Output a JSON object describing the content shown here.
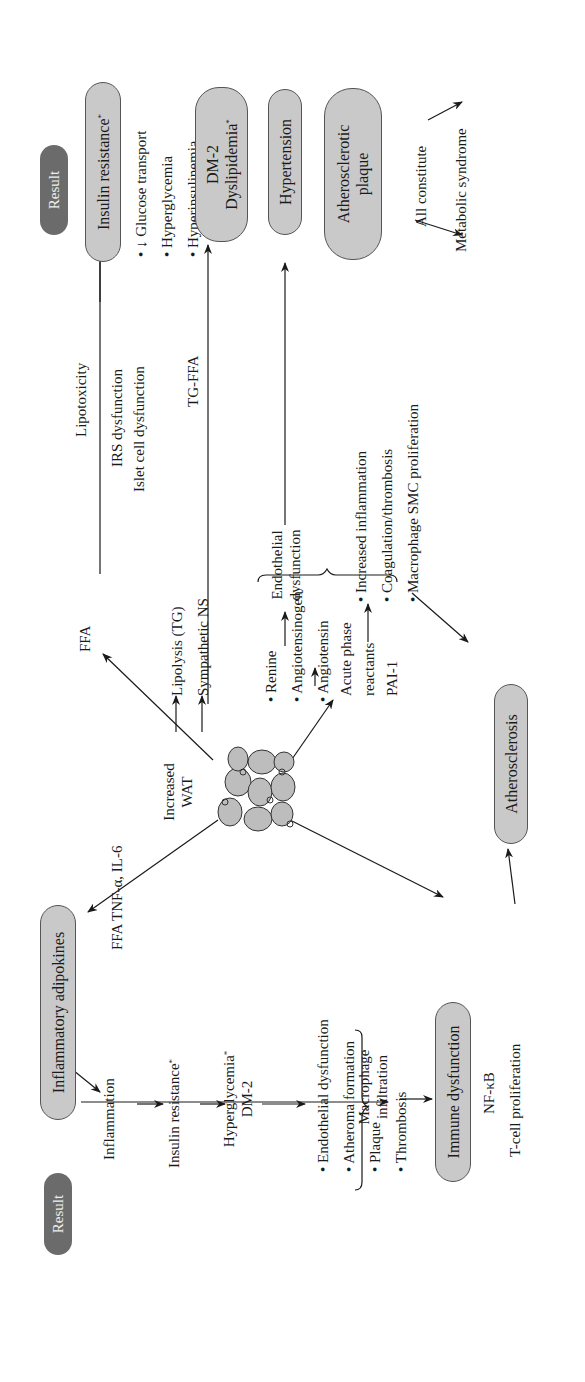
{
  "figure": {
    "orientation": "rotated-90-ccw",
    "colors": {
      "pill_fill": "#c9c9c9",
      "pill_border": "#555555",
      "result_fill": "#6b6b6b",
      "result_text": "#eeeeee",
      "line": "#1a1a1a",
      "cell_fill": "#bdbdbd"
    }
  },
  "result_labels": {
    "left": "Result",
    "right": "Result"
  },
  "center": {
    "label_line1": "Increased",
    "label_line2": "WAT"
  },
  "adipokines": {
    "pill": "Inflammatory adipokines",
    "edge_label": "FFA TNF-α, IL-6"
  },
  "left_chain": {
    "inflammation": "Inflammation",
    "insulin_resistance": "Insulin resistance",
    "insulin_resistance_mark": "*",
    "hyperglycemia": "Hyperglycemia",
    "hyperglycemia_mark": "*",
    "dm2": "DM-2",
    "outcomes": [
      "• Endothelial dysfunction",
      "• Atheroma formation",
      "• Plaque",
      "• Thrombosis"
    ]
  },
  "immune": {
    "macrophage_line1": "Macrophage",
    "macrophage_line2": "infiltration",
    "pill": "Immune dysfunction",
    "nfkb": "NF-κB",
    "tcell": "T-cell proliferation"
  },
  "atherosclerosis": {
    "pill": "Atherosclerosis"
  },
  "ffa_branch": {
    "ffa": "FFA",
    "lipolysis": "Lipolysis (TG)",
    "sympathetic": "Sympathetic NS",
    "lipotoxicity": "Lipotoxicity",
    "irs": "IRS dysfunction",
    "islet": "Islet cell dysfunction",
    "tg_ffa": "TG-FFA"
  },
  "raas": {
    "items": [
      "• Renine",
      "• Angiotensinogen",
      "• Angiotensin"
    ],
    "acute_line1": "Acute phase",
    "acute_line2": "reactants",
    "pai": "PAI-1",
    "endothelial_line1": "Endothelial",
    "endothelial_line2": "dysfunction",
    "inflammation_items": [
      "• Increased inflammation",
      "• Coagulation/thrombosis",
      "• Macrophage SMC proliferation"
    ]
  },
  "results_right": {
    "insulin_resistance": "Insulin resistance",
    "insulin_resistance_mark": "*",
    "ir_items": [
      "• ↓ Glucose transport",
      "•   Hyperglycemia",
      "•   Hyperinsulinemia"
    ],
    "dm2_line1": "DM-2",
    "dm2_line2": "Dyslipidemia",
    "dm2_mark": "*",
    "hypertension": "Hypertension",
    "plaque_line1": "Atherosclerotic",
    "plaque_line2": "plaque",
    "all_constitute": "All constitute",
    "metabolic_syndrome": "Metabolic syndrome"
  }
}
